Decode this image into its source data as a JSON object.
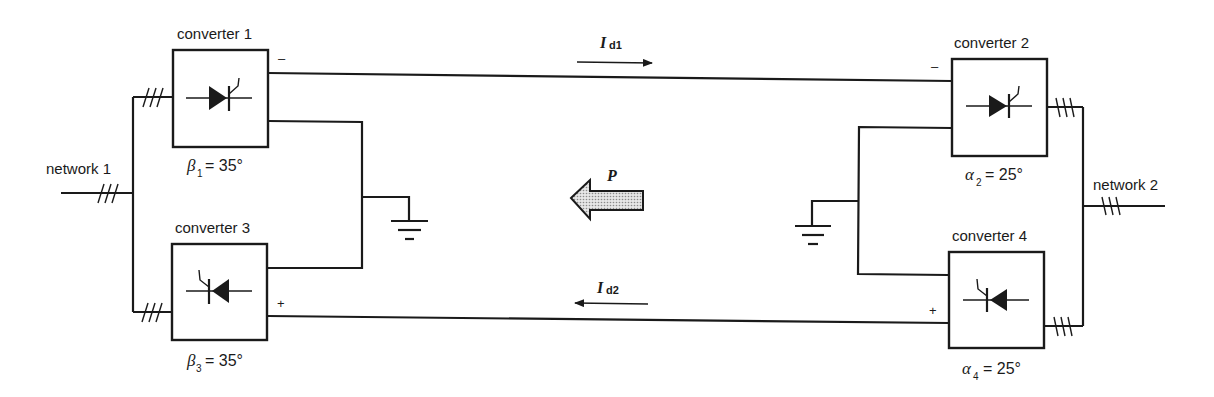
{
  "diagram": {
    "type": "HVDC bipolar link schematic",
    "colors": {
      "line": "#1a1a1a",
      "background": "#ffffff",
      "power_arrow_fill": "#c8c8c8"
    },
    "networks": [
      {
        "id": "network1",
        "label": "network 1"
      },
      {
        "id": "network2",
        "label": "network 2"
      }
    ],
    "converters": [
      {
        "id": "c1",
        "label": "converter 1",
        "angle_symbol": "β",
        "angle_sub": "1",
        "angle_value": "= 35°",
        "device": "thyristor-right"
      },
      {
        "id": "c2",
        "label": "converter 2",
        "angle_symbol": "α",
        "angle_sub": "2",
        "angle_value": "= 25°",
        "device": "thyristor-right"
      },
      {
        "id": "c3",
        "label": "converter 3",
        "angle_symbol": "β",
        "angle_sub": "3",
        "angle_value": "= 35°",
        "device": "thyristor-left"
      },
      {
        "id": "c4",
        "label": "converter 4",
        "angle_symbol": "α",
        "angle_sub": "4",
        "angle_value": "= 25°",
        "device": "thyristor-left"
      }
    ],
    "polarity": {
      "c1": "–",
      "c2": "–",
      "c3": "+",
      "c4": "+"
    },
    "currents": [
      {
        "id": "id1",
        "symbol": "I",
        "sub": "d1",
        "direction": "right"
      },
      {
        "id": "id2",
        "symbol": "I",
        "sub": "d2",
        "direction": "left"
      }
    ],
    "power_flow": {
      "symbol": "P",
      "direction": "left"
    },
    "three_phase_mark": "///",
    "grounds": 2
  }
}
